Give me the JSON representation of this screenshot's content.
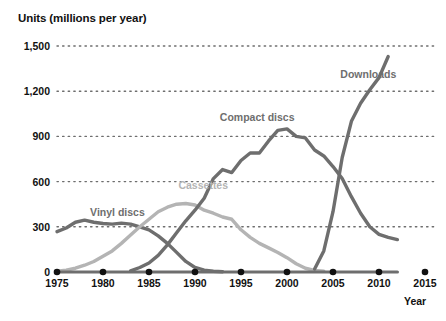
{
  "chart_data": {
    "type": "line",
    "title": "",
    "ylabel": "Units (millions per year)",
    "xlabel": "Year",
    "grid": "dotted-horizontal",
    "legend_position": "inline-labels",
    "xlim": [
      1975,
      2015
    ],
    "ylim": [
      0,
      1500
    ],
    "y_ticks": [
      "0",
      "300",
      "600",
      "900",
      "1,200",
      "1,500"
    ],
    "y_tick_values": [
      0,
      300,
      600,
      900,
      1200,
      1500
    ],
    "x_ticks": [
      "1975",
      "1980",
      "1985",
      "1990",
      "1995",
      "2000",
      "2005",
      "2010",
      "2015"
    ],
    "x_tick_values": [
      1975,
      1980,
      1985,
      1990,
      1995,
      2000,
      2005,
      2010,
      2015
    ],
    "series": [
      {
        "name": "Vinyl discs",
        "color": "#6e6e6e",
        "label_x": 1978.6,
        "label_y": 390,
        "x": [
          1975,
          1976,
          1977,
          1978,
          1979,
          1980,
          1981,
          1982,
          1983,
          1984,
          1985,
          1986,
          1987,
          1988,
          1989,
          1990,
          1991,
          1992,
          1993
        ],
        "values": [
          268,
          292,
          330,
          344,
          330,
          322,
          318,
          324,
          318,
          300,
          280,
          240,
          190,
          130,
          70,
          30,
          12,
          5,
          2
        ]
      },
      {
        "name": "Cassettes",
        "color": "#b4b4b4",
        "label_x": 1988.2,
        "label_y": 570,
        "x": [
          1975,
          1976,
          1977,
          1978,
          1979,
          1980,
          1981,
          1982,
          1983,
          1984,
          1985,
          1986,
          1987,
          1988,
          1989,
          1990,
          1991,
          1992,
          1993,
          1994,
          1995,
          1996,
          1997,
          1998,
          1999,
          2000,
          2001,
          2002,
          2003,
          2004
        ],
        "values": [
          5,
          12,
          25,
          45,
          70,
          105,
          140,
          190,
          245,
          300,
          350,
          400,
          430,
          450,
          455,
          445,
          410,
          390,
          365,
          350,
          280,
          230,
          190,
          160,
          130,
          95,
          55,
          25,
          10,
          5
        ]
      },
      {
        "name": "Compact discs",
        "color": "#6e6e6e",
        "label_x": 1992.7,
        "label_y": 1020,
        "x": [
          1983,
          1984,
          1985,
          1986,
          1987,
          1988,
          1989,
          1990,
          1991,
          1992,
          1993,
          1994,
          1995,
          1996,
          1997,
          1998,
          1999,
          2000,
          2001,
          2002,
          2003,
          2004,
          2005,
          2006,
          2007,
          2008,
          2009,
          2010,
          2011,
          2012
        ],
        "values": [
          8,
          30,
          60,
          110,
          180,
          260,
          340,
          410,
          490,
          620,
          680,
          660,
          740,
          790,
          790,
          870,
          940,
          950,
          900,
          890,
          810,
          770,
          700,
          620,
          500,
          390,
          300,
          250,
          230,
          215
        ]
      },
      {
        "name": "Downloads",
        "color": "#6e6e6e",
        "label_x": 2005.8,
        "label_y": 1310,
        "x": [
          2003,
          2004,
          2005,
          2006,
          2007,
          2008,
          2009,
          2010,
          2011
        ],
        "values": [
          20,
          140,
          400,
          760,
          1000,
          1120,
          1210,
          1290,
          1430
        ]
      }
    ],
    "colors": {
      "axis": "#6e6e6e",
      "grid": "#6e6e6e",
      "text": "#111111",
      "vinyl": "#6e6e6e",
      "cassettes": "#b4b4b4",
      "compact_discs": "#6e6e6e",
      "downloads": "#6e6e6e"
    }
  }
}
